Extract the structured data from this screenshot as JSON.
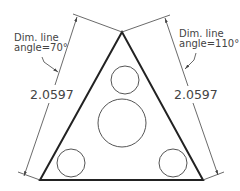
{
  "drawing": {
    "type": "technical-dimension-drawing",
    "colors": {
      "background": "#ffffff",
      "outline": "#222222",
      "circle": "#555555",
      "dimension": "#444444",
      "text": "#444444"
    },
    "triangle": {
      "apex": [
        122,
        32
      ],
      "bottom_left": [
        40,
        180
      ],
      "bottom_right": [
        203,
        180
      ]
    },
    "circles": [
      {
        "name": "top-hole",
        "cx": 125,
        "cy": 80,
        "r": 14
      },
      {
        "name": "center-hole",
        "cx": 122,
        "cy": 123,
        "r": 24
      },
      {
        "name": "bottom-left-hole",
        "cx": 71,
        "cy": 163,
        "r": 14
      },
      {
        "name": "bottom-right-hole",
        "cx": 173,
        "cy": 163,
        "r": 14
      }
    ],
    "left_dimension": {
      "value": "2.0597",
      "note_line1": "Dim. line",
      "note_line2": "angle=70°"
    },
    "right_dimension": {
      "value": "2.0597",
      "note_line1": "Dim. line",
      "note_line2": "angle=110°"
    }
  }
}
